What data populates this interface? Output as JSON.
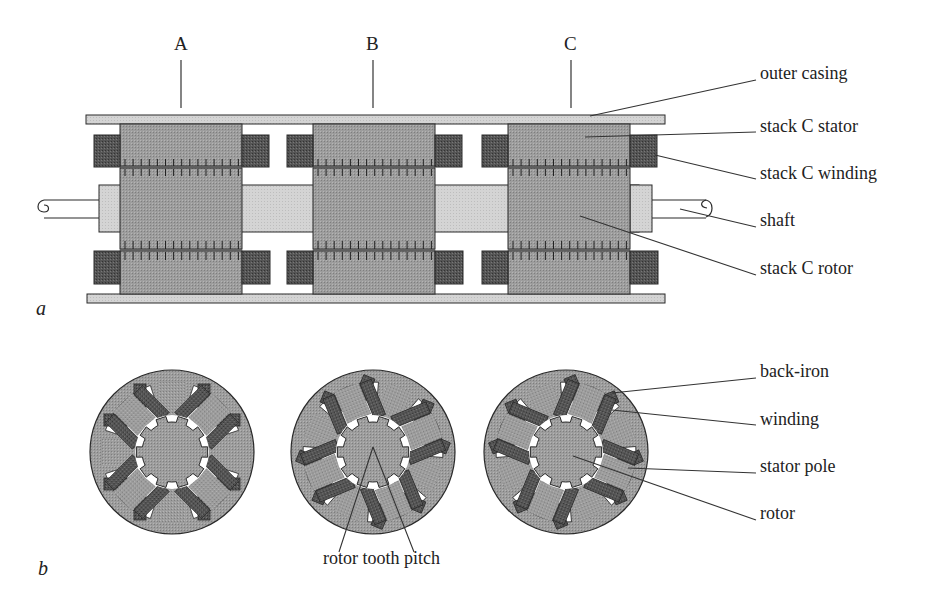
{
  "figure": {
    "colors": {
      "background": "#ffffff",
      "iron": "#9a9a9a",
      "iron_dark": "#8c8c8c",
      "casing": "#d2d2d2",
      "shaft": "#d0d0d0",
      "winding": "#4e4e4e",
      "outline": "#2a2a2a",
      "leader": "#333333"
    },
    "panel_a": {
      "label": "a",
      "stack_labels": [
        {
          "text": "A",
          "x": 181
        },
        {
          "text": "B",
          "x": 373
        },
        {
          "text": "C",
          "x": 571
        }
      ],
      "stacks_x": [
        120,
        313,
        508
      ],
      "stack_width": 122,
      "callouts": [
        {
          "text": "outer casing",
          "label_x": 756,
          "label_y": 80,
          "tx": 590,
          "ty": 116
        },
        {
          "text": "stack C stator",
          "label_x": 756,
          "label_y": 132,
          "tx": 585,
          "ty": 137
        },
        {
          "text": "stack C winding",
          "label_x": 756,
          "label_y": 179,
          "tx": 655,
          "ty": 155
        },
        {
          "text": "shaft",
          "label_x": 756,
          "label_y": 227,
          "tx": 680,
          "ty": 209
        },
        {
          "text": "stack C rotor",
          "label_x": 756,
          "label_y": 275,
          "tx": 580,
          "ty": 216
        }
      ]
    },
    "panel_b": {
      "label": "b",
      "cross_sections": [
        {
          "cx": 172,
          "cy": 452,
          "rotation": 0
        },
        {
          "cx": 373,
          "cy": 452,
          "rotation": 22.5
        },
        {
          "cx": 566,
          "cy": 452,
          "rotation": -22.5
        }
      ],
      "callouts": [
        {
          "text": "back-iron",
          "label_x": 756,
          "label_y": 378,
          "tx": 612,
          "ty": 393
        },
        {
          "text": "winding",
          "label_x": 756,
          "label_y": 425,
          "tx": 612,
          "ty": 410
        },
        {
          "text": "stator pole",
          "label_x": 756,
          "label_y": 473,
          "tx": 628,
          "ty": 468
        },
        {
          "text": "rotor",
          "label_x": 756,
          "label_y": 520,
          "tx": 573,
          "ty": 456
        }
      ],
      "pitch_label": {
        "text": "rotor tooth pitch",
        "x": 325,
        "y": 558
      }
    }
  }
}
